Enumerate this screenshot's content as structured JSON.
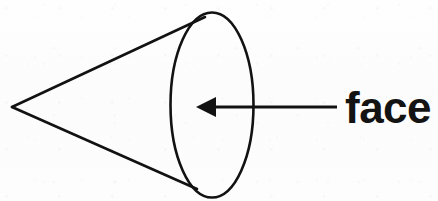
{
  "figure": {
    "kind": "geometry-diagram",
    "width": 438,
    "height": 201,
    "background_color": "#fdfdfd",
    "ink_color": "#121212"
  },
  "shape": {
    "name": "cone",
    "apex": {
      "x": 12,
      "y": 107
    },
    "base_ellipse": {
      "center_x": 212,
      "center_y": 105,
      "radius_x": 41.5,
      "radius_y": 92.5,
      "stroke_width": 2.6
    },
    "slant_lines": [
      {
        "x1": 12,
        "y1": 107,
        "x2": 205,
        "y2": 17,
        "stroke_width": 2.6
      },
      {
        "x1": 12,
        "y1": 107,
        "x2": 197,
        "y2": 189,
        "stroke_width": 2.6
      }
    ]
  },
  "annotation": {
    "label": "face",
    "label_x": 345,
    "label_baseline_y": 123,
    "font_size_px": 44,
    "font_weight": "bold",
    "leader": {
      "shaft_x_start": 337,
      "shaft_x_end": 214,
      "shaft_y": 107,
      "shaft_width": 2.8,
      "arrowhead_tip_x": 196,
      "arrowhead_base_x": 215,
      "arrowhead_half_height": 10,
      "direction": "points-left-at-base-face"
    }
  }
}
